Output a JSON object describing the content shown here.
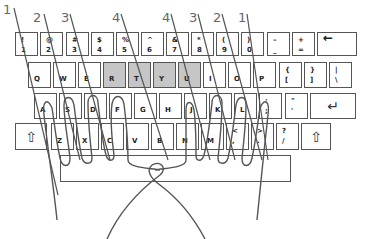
{
  "finger_labels": [
    {
      "text": "1",
      "x": 3,
      "y": 2
    },
    {
      "text": "2",
      "x": 33,
      "y": 8
    },
    {
      "text": "3",
      "x": 60,
      "y": 8
    },
    {
      "text": "4",
      "x": 111,
      "y": 8
    },
    {
      "text": "4",
      "x": 161,
      "y": 8
    },
    {
      "text": "3",
      "x": 188,
      "y": 8
    },
    {
      "text": "2",
      "x": 212,
      "y": 8
    },
    {
      "text": "1",
      "x": 237,
      "y": 8
    }
  ],
  "rows": {
    "row1": [
      {
        "top": "!",
        "bot": "1"
      },
      {
        "top": "@",
        "bot": "2"
      },
      {
        "top": "#",
        "bot": "3"
      },
      {
        "top": "$",
        "bot": "4"
      },
      {
        "top": "%",
        "bot": "5"
      },
      {
        "top": "^",
        "bot": "6"
      },
      {
        "top": "&",
        "bot": "7"
      },
      {
        "top": "*",
        "bot": "8"
      },
      {
        "top": "(",
        "bot": "9"
      },
      {
        "top": ")",
        "bot": "0"
      },
      {
        "top": "–",
        "bot": "_"
      },
      {
        "top": "+",
        "bot": "="
      }
    ],
    "backspace_icon": "←",
    "row2": [
      {
        "label": "Q"
      },
      {
        "label": "W"
      },
      {
        "label": "E"
      },
      {
        "label": "R",
        "hl": true
      },
      {
        "label": "T",
        "hl": true
      },
      {
        "label": "Y",
        "hl": true
      },
      {
        "label": "U",
        "hl": true
      },
      {
        "label": "I"
      },
      {
        "label": "O"
      },
      {
        "label": "P"
      },
      {
        "top": "{",
        "bot": "["
      },
      {
        "top": "}",
        "bot": "]"
      },
      {
        "top": "|",
        "bot": "\\"
      }
    ],
    "row3": [
      {
        "label": "A"
      },
      {
        "label": "S"
      },
      {
        "label": "D"
      },
      {
        "label": "F"
      },
      {
        "label": "G"
      },
      {
        "label": "H"
      },
      {
        "label": "J"
      },
      {
        "label": "K"
      },
      {
        "label": "L"
      },
      {
        "top": ":",
        "bot": ";"
      },
      {
        "top": "\"",
        "bot": "'"
      }
    ],
    "enter_icon": "↵",
    "row4": [
      {
        "label": "Z"
      },
      {
        "label": "X"
      },
      {
        "label": "C"
      },
      {
        "label": "V"
      },
      {
        "label": "B"
      },
      {
        "label": "N"
      },
      {
        "label": "M"
      },
      {
        "top": "<",
        "bot": ","
      },
      {
        "top": ">",
        "bot": "."
      },
      {
        "top": "?",
        "bot": "/"
      }
    ],
    "shift_icon": "⇧"
  },
  "colors": {
    "highlight": "#c6c6c6",
    "outline": "#555555",
    "strokes": "#555555"
  }
}
